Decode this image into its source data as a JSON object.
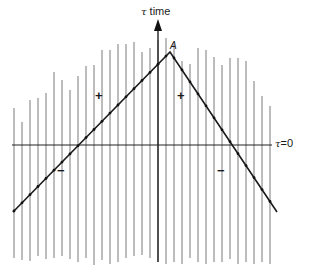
{
  "diagram": {
    "axis_label": {
      "symbol": "τ",
      "text": "time"
    },
    "peak_label": "A",
    "horizon_label": {
      "symbol": "τ",
      "text": "=0"
    },
    "signs": [
      {
        "id": "upper-left",
        "text": "+",
        "x": 100,
        "y": 96
      },
      {
        "id": "upper-right",
        "text": "+",
        "x": 183,
        "y": 96
      },
      {
        "id": "lower-left",
        "text": "−",
        "x": 60,
        "y": 164
      },
      {
        "id": "lower-right",
        "text": "−",
        "x": 220,
        "y": 164
      }
    ],
    "colors": {
      "lines": "#7a7a7a",
      "axis": "#222222",
      "diagonal": "#1a1a1a"
    },
    "horizontal_line_y": 145,
    "peak": {
      "x": 170,
      "y": 52
    },
    "diagonal_left_end": {
      "x": 13,
      "y": 212
    },
    "diagonal_right_end": {
      "x": 277,
      "y": 212
    },
    "vertical_lines": [
      {
        "x": 14,
        "top": 108,
        "bottom": 258
      },
      {
        "x": 22,
        "top": 122,
        "bottom": 260
      },
      {
        "x": 30,
        "top": 100,
        "bottom": 261
      },
      {
        "x": 38,
        "top": 98,
        "bottom": 256
      },
      {
        "x": 46,
        "top": 93,
        "bottom": 259
      },
      {
        "x": 54,
        "top": 72,
        "bottom": 258
      },
      {
        "x": 62,
        "top": 80,
        "bottom": 256
      },
      {
        "x": 70,
        "top": 90,
        "bottom": 259
      },
      {
        "x": 78,
        "top": 76,
        "bottom": 262
      },
      {
        "x": 86,
        "top": 66,
        "bottom": 258
      },
      {
        "x": 94,
        "top": 65,
        "bottom": 265
      },
      {
        "x": 102,
        "top": 50,
        "bottom": 260
      },
      {
        "x": 110,
        "top": 50,
        "bottom": 264
      },
      {
        "x": 118,
        "top": 44,
        "bottom": 262
      },
      {
        "x": 126,
        "top": 44,
        "bottom": 258
      },
      {
        "x": 134,
        "top": 42,
        "bottom": 256
      },
      {
        "x": 142,
        "top": 52,
        "bottom": 255
      },
      {
        "x": 150,
        "top": 48,
        "bottom": 258
      },
      {
        "x": 158,
        "top": 40,
        "bottom": 262
      },
      {
        "x": 166,
        "top": 38,
        "bottom": 264
      },
      {
        "x": 174,
        "top": 44,
        "bottom": 262
      },
      {
        "x": 182,
        "top": 61,
        "bottom": 264
      },
      {
        "x": 190,
        "top": 64,
        "bottom": 258
      },
      {
        "x": 198,
        "top": 48,
        "bottom": 262
      },
      {
        "x": 206,
        "top": 50,
        "bottom": 264
      },
      {
        "x": 214,
        "top": 57,
        "bottom": 262
      },
      {
        "x": 222,
        "top": 65,
        "bottom": 262
      },
      {
        "x": 230,
        "top": 58,
        "bottom": 259
      },
      {
        "x": 238,
        "top": 58,
        "bottom": 264
      },
      {
        "x": 246,
        "top": 61,
        "bottom": 262
      },
      {
        "x": 254,
        "top": 81,
        "bottom": 264
      },
      {
        "x": 262,
        "top": 96,
        "bottom": 262
      },
      {
        "x": 270,
        "top": 106,
        "bottom": 264
      }
    ]
  }
}
